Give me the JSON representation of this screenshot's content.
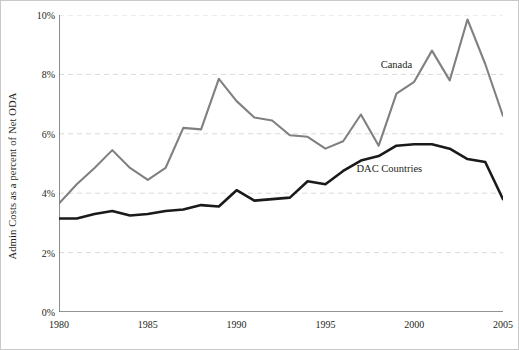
{
  "chart_data": {
    "type": "line",
    "title": "",
    "xlabel": "",
    "ylabel": "Admin Costs as a percent of Net ODA",
    "xlim": [
      1980,
      2005
    ],
    "ylim": [
      0,
      10
    ],
    "yticks": [
      "0%",
      "2%",
      "4%",
      "6%",
      "8%",
      "10%"
    ],
    "ytick_values": [
      0,
      2,
      4,
      6,
      8,
      10
    ],
    "xticks": [
      "1980",
      "1985",
      "1990",
      "1995",
      "2000",
      "2005"
    ],
    "xtick_values": [
      1980,
      1985,
      1990,
      1995,
      2000,
      2005
    ],
    "grid": "horizontal-dashed",
    "legend": "inline-annotations",
    "x": [
      1980,
      1981,
      1982,
      1983,
      1984,
      1985,
      1986,
      1987,
      1988,
      1989,
      1990,
      1991,
      1992,
      1993,
      1994,
      1995,
      1996,
      1997,
      1998,
      1999,
      2000,
      2001,
      2002,
      2003,
      2004,
      2005
    ],
    "series": [
      {
        "name": "Canada",
        "color": "#808080",
        "values": [
          3.65,
          4.3,
          4.85,
          5.45,
          4.85,
          4.45,
          4.85,
          6.2,
          6.15,
          7.85,
          7.1,
          6.55,
          6.45,
          5.95,
          5.9,
          5.5,
          5.75,
          6.65,
          5.6,
          7.35,
          7.75,
          8.8,
          7.8,
          9.85,
          8.35,
          6.6
        ]
      },
      {
        "name": "DAC Countries",
        "color": "#1a1a1a",
        "values": [
          3.15,
          3.15,
          3.3,
          3.4,
          3.25,
          3.3,
          3.4,
          3.45,
          3.6,
          3.55,
          4.1,
          3.75,
          3.8,
          3.85,
          4.4,
          4.3,
          4.75,
          5.1,
          5.25,
          5.6,
          5.65,
          5.65,
          5.5,
          5.15,
          5.05,
          3.8
        ]
      }
    ],
    "annotations": [
      {
        "text": "Canada",
        "x": 1999.0,
        "y": 8.35
      },
      {
        "text": "DAC Countries",
        "x": 1998.6,
        "y": 4.85
      }
    ]
  }
}
